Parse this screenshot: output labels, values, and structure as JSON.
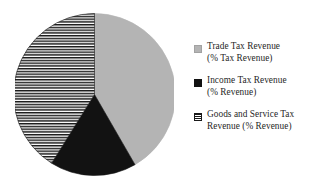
{
  "chart_data": {
    "type": "pie",
    "title": "",
    "subtitle": "",
    "xlabel": "",
    "ylabel": "",
    "grid": false,
    "legend_position": "right",
    "start_angle_deg": 0,
    "direction": "clockwise",
    "categories": [
      "Trade Tax Revenue (% Tax Revenue)",
      "Income Tax Revenue (% Revenue)",
      "Goods and Service Tax Revenue (% Revenue)"
    ],
    "values": [
      42,
      17,
      41
    ],
    "slices": [
      {
        "label": "Trade Tax Revenue (% Tax Revenue)",
        "value": 42,
        "start_deg": 0,
        "end_deg": 150,
        "fill": "solid",
        "color": "#b4b4b4"
      },
      {
        "label": "Income Tax Revenue (% Revenue)",
        "value": 17,
        "start_deg": 150,
        "end_deg": 212,
        "fill": "solid",
        "color": "#121212"
      },
      {
        "label": "Goods and Service Tax Revenue (% Revenue)",
        "value": 41,
        "start_deg": 212,
        "end_deg": 360,
        "fill": "horizontal-stripes",
        "color": "#1a1a1a"
      }
    ]
  },
  "legend": {
    "items": [
      {
        "swatch": "legend-swatch-gray",
        "line1": "Trade Tax Revenue",
        "line2": "(% Tax Revenue)"
      },
      {
        "swatch": "legend-swatch-black",
        "line1": "Income Tax Revenue",
        "line2": "(% Revenue)"
      },
      {
        "swatch": "legend-swatch-striped",
        "line1": "Goods and Service Tax",
        "line2": "Revenue (% Revenue)"
      }
    ]
  },
  "colors": {
    "background": "#ffffff",
    "slice_gray": "#b4b4b4",
    "slice_black": "#121212",
    "stripe_ink": "#1a1a1a",
    "text": "#1f1f1f"
  }
}
